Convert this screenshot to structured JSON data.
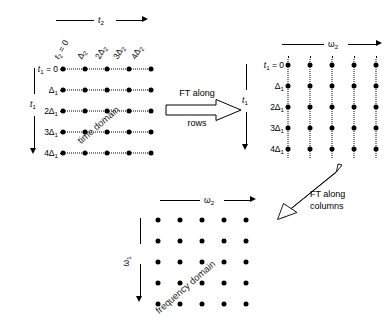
{
  "figure": {
    "dot_color": "#000000",
    "line_color": "#000000",
    "background": "#ffffff"
  },
  "panels": {
    "time_domain": {
      "caption": "time domain",
      "x_axis_label": "t₂",
      "y_axis_label": "t₁",
      "column_labels": [
        "t₂ = 0",
        "Δ₂",
        "2Δ₂",
        "3Δ₂",
        "4Δ₂"
      ],
      "row_labels": [
        "t₁ = 0",
        "Δ₁",
        "2Δ₁",
        "3Δ₁",
        "4Δ₁"
      ],
      "rows": 5,
      "cols": 5,
      "connector": "horizontal-dotted"
    },
    "mixed_domain": {
      "caption": "",
      "x_axis_label": "ω₂",
      "y_axis_label": "t₁",
      "row_labels": [
        "t₁ = 0",
        "Δ₁",
        "2Δ₁",
        "3Δ₁",
        "4Δ₁"
      ],
      "rows": 5,
      "cols": 5,
      "connector": "vertical-dotted"
    },
    "frequency_domain": {
      "caption": "frequency domain",
      "x_axis_label": "ω₂",
      "y_axis_label": "ω₁",
      "rows": 5,
      "cols": 5,
      "connector": "none"
    }
  },
  "transforms": {
    "first": {
      "line1": "FT along",
      "line2": "rows",
      "direction": "right",
      "style": "hollow-block-arrow"
    },
    "second": {
      "line1": "FT along",
      "line2": "columns",
      "direction": "down-left-diagonal",
      "style": "hollow-thin-arrow"
    }
  },
  "column_labels_raw": {
    "c0": "t",
    "c0sub": "2",
    "c0eq": " = 0",
    "c1": "Δ",
    "c1sub": "2",
    "c2": "2Δ",
    "c2sub": "2",
    "c3": "3Δ",
    "c3sub": "2",
    "c4": "4Δ",
    "c4sub": "2"
  },
  "row_labels_raw": {
    "r0": "t",
    "r0sub": "1",
    "r0eq": " = 0",
    "r1": "Δ",
    "r1sub": "1",
    "r2": "2Δ",
    "r2sub": "1",
    "r3": "3Δ",
    "r3sub": "1",
    "r4": "4Δ",
    "r4sub": "1"
  },
  "symbols": {
    "t": "t",
    "omega": "ω",
    "delta": "Δ",
    "sub1": "1",
    "sub2": "2"
  }
}
